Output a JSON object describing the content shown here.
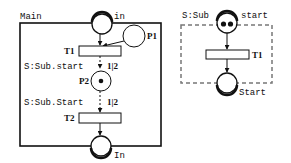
{
  "main": {
    "title": "Main",
    "places": {
      "in": {
        "label": "in",
        "tokens": 0
      },
      "p1": {
        "label": "P1",
        "tokens": 0
      },
      "p2": {
        "label": "P2",
        "tokens": 1
      },
      "out": {
        "label": "In",
        "tokens": 0
      }
    },
    "transitions": {
      "t1": {
        "label": "T1"
      },
      "t2": {
        "label": "T2"
      }
    },
    "sync_labels": {
      "first": {
        "text": "S:Sub.start",
        "mult": "1|2"
      },
      "second": {
        "text": "S:Sub.Start",
        "mult": "1|2"
      }
    }
  },
  "sub": {
    "title": "S:Sub",
    "places": {
      "start": {
        "label": "start",
        "tokens": 2
      },
      "end": {
        "label": "Start",
        "tokens": 0
      }
    },
    "transitions": {
      "t1": {
        "label": "T1"
      }
    }
  },
  "colors": {
    "stroke": "#111111",
    "dashed": "#777777",
    "background": "#ffffff"
  }
}
